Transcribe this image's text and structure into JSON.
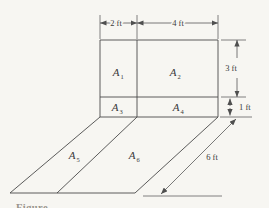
{
  "figure": {
    "caption": "Figure",
    "colors": {
      "background": "#f7f6f2",
      "line": "#4a4a4a",
      "text": "#3a3a3a"
    },
    "areas": [
      {
        "name": "A1",
        "base": "A",
        "sub": "1"
      },
      {
        "name": "A2",
        "base": "A",
        "sub": "2"
      },
      {
        "name": "A3",
        "base": "A",
        "sub": "3"
      },
      {
        "name": "A4",
        "base": "A",
        "sub": "4"
      },
      {
        "name": "A5",
        "base": "A",
        "sub": "5"
      },
      {
        "name": "A6",
        "base": "A",
        "sub": "6"
      }
    ],
    "dims": {
      "width_left": "2 ft",
      "width_right": "4 ft",
      "height_upper": "3 ft",
      "height_lower": "1 ft",
      "depth": "6 ft"
    }
  }
}
